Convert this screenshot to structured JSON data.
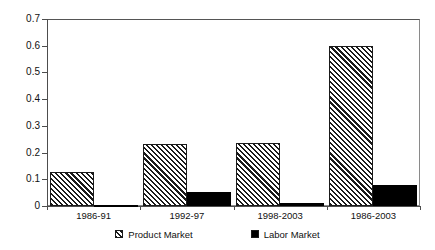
{
  "chart_data": {
    "type": "bar",
    "title": "",
    "subtitle": "",
    "xlabel": "",
    "ylabel": "",
    "categories": [
      "1986-91",
      "1992-97",
      "1998-2003",
      "1986-2003"
    ],
    "series": [
      {
        "name": "Product Market",
        "values": [
          0.128,
          0.232,
          0.234,
          0.598
        ],
        "fill": "diagonal-hatch",
        "color": "#1a1a1a"
      },
      {
        "name": "Labor Market",
        "values": [
          0.002,
          0.053,
          0.012,
          0.077
        ],
        "fill": "solid",
        "color": "#000000"
      }
    ],
    "ylim": [
      0,
      0.7
    ],
    "ytick_values": [
      0,
      0.1,
      0.2,
      0.3,
      0.4,
      0.5,
      0.6,
      0.7
    ],
    "ytick_labels": [
      "0",
      "0.1",
      "0.2",
      "0.3",
      "0.4",
      "0.5",
      "0.6",
      "0.7"
    ],
    "grid": false,
    "legend_position": "bottom"
  },
  "legend": {
    "items": [
      {
        "label": "Product Market",
        "swatch": "hatched-square-swatch"
      },
      {
        "label": "Labor Market",
        "swatch": "filled-square-swatch"
      }
    ]
  }
}
